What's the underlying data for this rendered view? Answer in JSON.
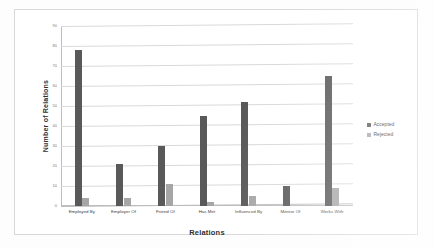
{
  "chart_data": {
    "type": "bar",
    "title": "",
    "xlabel": "Relations",
    "ylabel": "Number of Relations",
    "ylim": [
      0,
      90
    ],
    "ytick_step": 10,
    "yticks": [
      "90",
      "80",
      "70",
      "60",
      "50",
      "40",
      "30",
      "20",
      "10",
      "0"
    ],
    "grid": true,
    "legend_position": "right",
    "categories": [
      "Employed By",
      "Employer Of",
      "Friend Of",
      "Has Met",
      "Influenced By",
      "Mentor Of",
      "Works With"
    ],
    "series": [
      {
        "name": "Accepted",
        "color": "#595959",
        "values": [
          78,
          21,
          30,
          45,
          52,
          10,
          65
        ]
      },
      {
        "name": "Rejected",
        "color": "#a6a6a6",
        "values": [
          4,
          4,
          11,
          2,
          5,
          0,
          9
        ]
      }
    ]
  },
  "legend": {
    "items": [
      {
        "label": "Accepted",
        "marker": "square-swatch-dark"
      },
      {
        "label": "Rejected",
        "marker": "square-swatch-light"
      }
    ]
  }
}
